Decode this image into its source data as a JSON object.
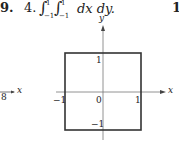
{
  "problem": {
    "prev_number": "9.",
    "number": "4.",
    "integral_sign": "∫",
    "outer_lower": "−1",
    "outer_upper": "1",
    "inner_lower": "−1",
    "inner_upper": "1",
    "differentials": "dx dy.",
    "next_number": "11"
  },
  "left_fragment": {
    "tick_label": "8",
    "axis_label": "x"
  },
  "figure": {
    "x_axis_label": "x",
    "y_axis_label": "y",
    "origin_label": "0",
    "x_neg_label": "−1",
    "x_pos_label": "1",
    "y_pos_label": "1",
    "y_neg_label": "−1",
    "region": {
      "x_min": -1,
      "x_max": 1,
      "y_min": -1,
      "y_max": 1
    }
  }
}
